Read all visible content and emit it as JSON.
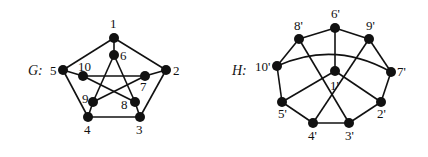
{
  "graphs": [
    {
      "name": "G:",
      "name_pos": [
        28,
        75
      ],
      "nodes": [
        {
          "id": "1",
          "label": "1",
          "x": 114,
          "y": 38,
          "lx": 110,
          "ly": 28
        },
        {
          "id": "2",
          "label": "2",
          "x": 166,
          "y": 70,
          "lx": 173,
          "ly": 75
        },
        {
          "id": "3",
          "label": "3",
          "x": 140,
          "y": 117,
          "lx": 136,
          "ly": 134
        },
        {
          "id": "4",
          "label": "4",
          "x": 88,
          "y": 117,
          "lx": 84,
          "ly": 134
        },
        {
          "id": "5",
          "label": "5",
          "x": 63,
          "y": 70,
          "lx": 50,
          "ly": 75
        },
        {
          "id": "6",
          "label": "6",
          "x": 114,
          "y": 55,
          "lx": 120,
          "ly": 60
        },
        {
          "id": "7",
          "label": "7",
          "x": 145,
          "y": 76,
          "lx": 140,
          "ly": 91
        },
        {
          "id": "8",
          "label": "8",
          "x": 135,
          "y": 102,
          "lx": 121,
          "ly": 109
        },
        {
          "id": "9",
          "label": "9",
          "x": 93,
          "y": 102,
          "lx": 82,
          "ly": 103
        },
        {
          "id": "10",
          "label": "10",
          "x": 83,
          "y": 76,
          "lx": 78,
          "ly": 71
        }
      ],
      "edges": [
        [
          "1",
          "2"
        ],
        [
          "2",
          "3"
        ],
        [
          "3",
          "4"
        ],
        [
          "4",
          "5"
        ],
        [
          "5",
          "1"
        ],
        [
          "1",
          "6"
        ],
        [
          "2",
          "7"
        ],
        [
          "3",
          "8"
        ],
        [
          "4",
          "9"
        ],
        [
          "5",
          "10"
        ],
        [
          "6",
          "9"
        ],
        [
          "9",
          "7"
        ],
        [
          "7",
          "10"
        ],
        [
          "10",
          "8"
        ],
        [
          "8",
          "6"
        ]
      ]
    },
    {
      "name": "H:",
      "name_pos": [
        232,
        75
      ],
      "nodes": [
        {
          "id": "1'",
          "label": "1'",
          "x": 335,
          "y": 71,
          "lx": 330,
          "ly": 90
        },
        {
          "id": "2'",
          "label": "2'",
          "x": 381,
          "y": 102,
          "lx": 377,
          "ly": 118
        },
        {
          "id": "3'",
          "label": "3'",
          "x": 349,
          "y": 123,
          "lx": 345,
          "ly": 140
        },
        {
          "id": "4'",
          "label": "4'",
          "x": 313,
          "y": 123,
          "lx": 308,
          "ly": 140
        },
        {
          "id": "5'",
          "label": "5'",
          "x": 282,
          "y": 102,
          "lx": 278,
          "ly": 118
        },
        {
          "id": "6'",
          "label": "6'",
          "x": 335,
          "y": 28,
          "lx": 331,
          "ly": 18
        },
        {
          "id": "7'",
          "label": "7'",
          "x": 391,
          "y": 72,
          "lx": 397,
          "ly": 76
        },
        {
          "id": "8'",
          "label": "8'",
          "x": 299,
          "y": 39,
          "lx": 294,
          "ly": 30
        },
        {
          "id": "9'",
          "label": "9'",
          "x": 369,
          "y": 39,
          "lx": 366,
          "ly": 30
        },
        {
          "id": "10'",
          "label": "10'",
          "x": 277,
          "y": 66,
          "lx": 255,
          "ly": 71
        }
      ],
      "edges": [
        [
          "8'",
          "6'"
        ],
        [
          "6'",
          "9'"
        ],
        [
          "9'",
          "7'"
        ],
        [
          "7'",
          "2'"
        ],
        [
          "2'",
          "3'"
        ],
        [
          "3'",
          "4'"
        ],
        [
          "4'",
          "5'"
        ],
        [
          "5'",
          "10'"
        ],
        [
          "10'",
          "8'"
        ],
        [
          "6'",
          "1'"
        ],
        [
          "1'",
          "5'"
        ],
        [
          "1'",
          "2'"
        ],
        [
          "8'",
          "3'"
        ],
        [
          "9'",
          "4'"
        ]
      ],
      "curved_edges": [
        {
          "from": "10'",
          "to": "7'",
          "control": [
            335,
            40
          ]
        }
      ]
    }
  ]
}
